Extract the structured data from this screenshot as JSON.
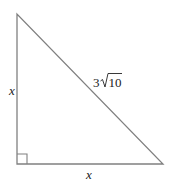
{
  "diagram": {
    "type": "right-triangle",
    "stroke_color": "#808080",
    "label_color": "#222222",
    "vertices": {
      "top": [
        17,
        14
      ],
      "right_angle": [
        17,
        164
      ],
      "bottom_right": [
        163,
        164
      ]
    },
    "right_angle_marker": true,
    "labels": {
      "left_leg": "x",
      "bottom_leg": "x",
      "hypotenuse_coefficient": "3",
      "hypotenuse_radicand": "10"
    }
  }
}
